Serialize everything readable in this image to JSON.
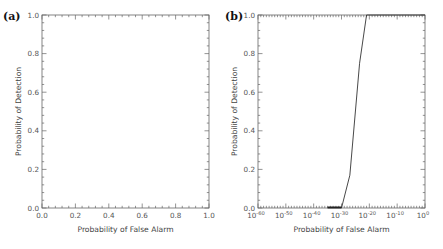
{
  "chart_data": [
    {
      "panel": "(a)",
      "type": "line",
      "title": "",
      "xlabel": "Probability of False Alarm",
      "ylabel": "Probability of Detection",
      "xscale": "linear",
      "xlim": [
        0.0,
        1.0
      ],
      "ylim": [
        0.0,
        1.0
      ],
      "xticks": [
        "0.0",
        "0.2",
        "0.4",
        "0.6",
        "0.8",
        "1.0"
      ],
      "yticks": [
        "0.0",
        "0.2",
        "0.4",
        "0.6",
        "0.8",
        "1.0"
      ],
      "grid": false,
      "series": []
    },
    {
      "panel": "(b)",
      "type": "line",
      "title": "",
      "xlabel": "Probability of False Alarm",
      "ylabel": "Probability of Detection",
      "xscale": "log",
      "xlim": [
        1e-60,
        1
      ],
      "ylim": [
        0.0,
        1.0
      ],
      "xticks": [
        "10^-60",
        "10^-50",
        "10^-40",
        "10^-30",
        "10^-20",
        "10^-10",
        "10^0"
      ],
      "yticks": [
        "0.0",
        "0.2",
        "0.4",
        "0.6",
        "0.8",
        "1.0"
      ],
      "grid": false,
      "series": [
        {
          "name": "ROC",
          "x_log10": [
            -35,
            -30,
            -27,
            -23.5,
            -21,
            -19,
            0
          ],
          "y": [
            0.0,
            0.0,
            0.17,
            0.75,
            1.0,
            1.0,
            1.0
          ]
        }
      ]
    }
  ],
  "panels": {
    "a": {
      "label": "(a)",
      "xlabel": "Probability of False Alarm",
      "ylabel": "Probability of Detection",
      "xticks": [
        "0.0",
        "0.2",
        "0.4",
        "0.6",
        "0.8",
        "1.0"
      ],
      "yticks": [
        "0.0",
        "0.2",
        "0.4",
        "0.6",
        "0.8",
        "1.0"
      ]
    },
    "b": {
      "label": "(b)",
      "xlabel": "Probability of False Alarm",
      "ylabel": "Probability of Detection",
      "xtick_exponents": [
        "-60",
        "-50",
        "-40",
        "-30",
        "-20",
        "-10",
        "0"
      ],
      "xtick_base": "10",
      "yticks": [
        "0.0",
        "0.2",
        "0.4",
        "0.6",
        "0.8",
        "1.0"
      ]
    }
  }
}
